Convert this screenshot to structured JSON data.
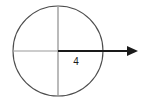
{
  "figure": {
    "background_color": "#ffffff",
    "width": 145,
    "height": 105,
    "circle": {
      "name": "circle-outline",
      "center_x": 58,
      "center_y": 51,
      "radius": 45,
      "stroke_color": "#4d4d4d",
      "stroke_width": 1.1,
      "fill": "none"
    },
    "vertical_diameter": {
      "name": "vertical-diameter-line",
      "x": 58,
      "y_start": 7,
      "y_end": 96,
      "stroke_color": "#8c8c8c",
      "stroke_width": 1.2
    },
    "horizontal_left_segment": {
      "name": "horizontal-left-radius-line",
      "x_start": 13,
      "x_end": 58,
      "y": 51,
      "stroke_color": "#9a9a9a",
      "stroke_width": 1.2
    },
    "radius_arrow": {
      "name": "radius-arrow",
      "x_start": 58,
      "x_end": 138,
      "y": 51,
      "stroke_color": "#1a1a1a",
      "stroke_width": 1.8,
      "arrowhead_length": 11,
      "arrowhead_half_height": 5
    },
    "labels": {
      "radius_value": "4",
      "radius_value_x": 76,
      "radius_value_y": 65,
      "radius_value_color": "#1a1a1a"
    }
  }
}
